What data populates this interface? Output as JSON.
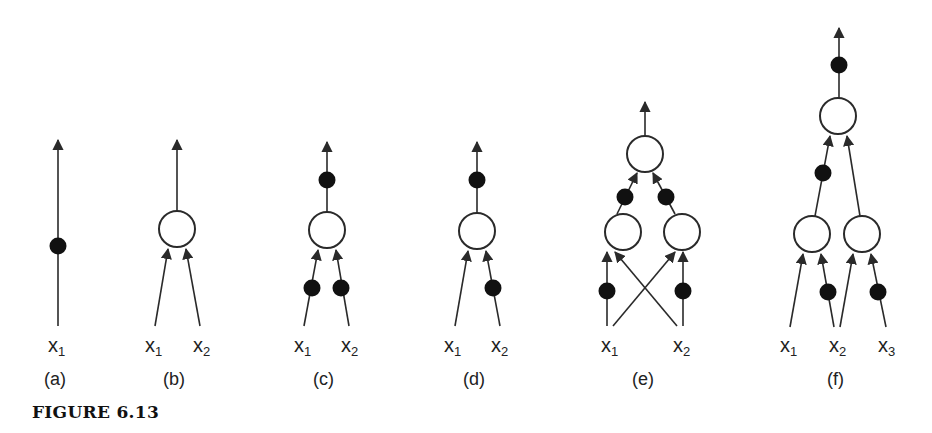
{
  "figure": {
    "caption": "FIGURE 6.13",
    "colors": {
      "line": "#2a2a2a",
      "dot": "#111111",
      "node_fill": "#ffffff"
    },
    "panels": [
      {
        "id": "a",
        "label": "(a)",
        "inputs": [
          {
            "name": "x",
            "sub": "1"
          }
        ],
        "description": "single weighted connection with arrow upward"
      },
      {
        "id": "b",
        "label": "(b)",
        "inputs": [
          {
            "name": "x",
            "sub": "1"
          },
          {
            "name": "x",
            "sub": "2"
          }
        ],
        "description": "one node, two unweighted inputs, output arrow"
      },
      {
        "id": "c",
        "label": "(c)",
        "inputs": [
          {
            "name": "x",
            "sub": "1"
          },
          {
            "name": "x",
            "sub": "2"
          }
        ],
        "description": "one node, both inputs weighted, output weighted"
      },
      {
        "id": "d",
        "label": "(d)",
        "inputs": [
          {
            "name": "x",
            "sub": "1"
          },
          {
            "name": "x",
            "sub": "2"
          }
        ],
        "description": "one node, only x2 input weighted, output weighted"
      },
      {
        "id": "e",
        "label": "(e)",
        "inputs": [
          {
            "name": "x",
            "sub": "1"
          },
          {
            "name": "x",
            "sub": "2"
          }
        ],
        "description": "two hidden nodes with crossed inputs, weighted links to top node"
      },
      {
        "id": "f",
        "label": "(f)",
        "inputs": [
          {
            "name": "x",
            "sub": "1"
          },
          {
            "name": "x",
            "sub": "2"
          },
          {
            "name": "x",
            "sub": "3"
          }
        ],
        "description": "two hidden nodes sharing x2, top node with weighted output"
      }
    ]
  }
}
